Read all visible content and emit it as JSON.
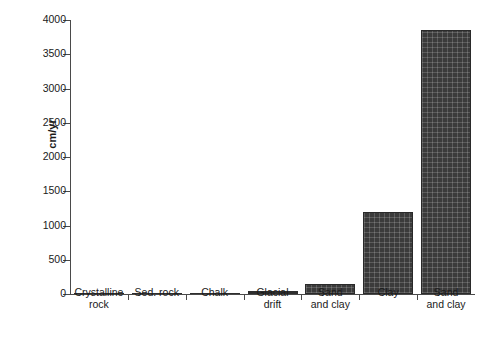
{
  "chart_data": {
    "type": "bar",
    "title": "",
    "xlabel": "",
    "ylabel": "cm/yr",
    "categories": [
      "Crystalline\nrock",
      "Sed. rock",
      "Chalk",
      "Glacial\ndrift",
      "Sand\nand clay",
      "Clay",
      "Sand\nand clay"
    ],
    "values": [
      2,
      8,
      20,
      40,
      150,
      1200,
      3850
    ],
    "ylim": [
      0,
      4000
    ],
    "yticks": [
      0,
      500,
      1000,
      1500,
      2000,
      2500,
      3000,
      3500,
      4000
    ],
    "ytick_labels": [
      "0",
      "500",
      "1000",
      "1500",
      "2000",
      "2500",
      "3000",
      "3500",
      "4000"
    ],
    "grid": false,
    "legend": null,
    "bar_color": "#3b3b3b",
    "axis_color": "#4a4a4a",
    "background": "#ffffff"
  }
}
